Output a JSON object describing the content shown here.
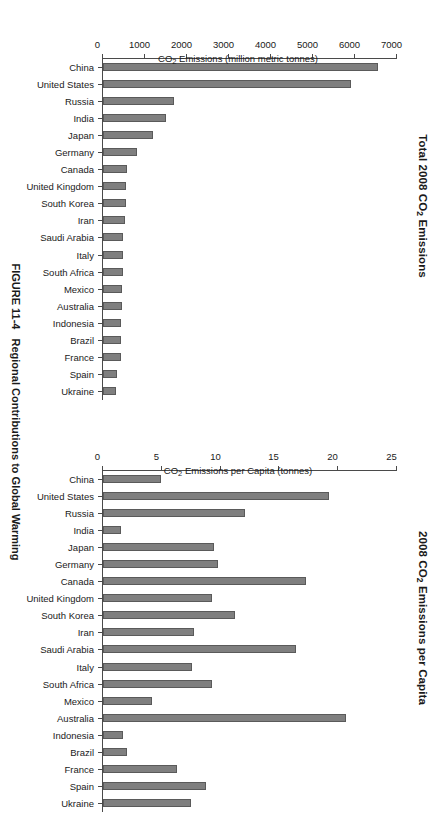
{
  "figure": {
    "number": "FIGURE 11-4",
    "caption": "Regional Contributions to Global Warming"
  },
  "chart_data": [
    {
      "type": "bar",
      "id": "total-emissions",
      "title": "Total 2008 CO2 Emissions",
      "title_main": "Total 2008 CO",
      "title_sub": "2",
      "title_tail": " Emissions",
      "xlabel": "",
      "ylabel": "CO2 Emissions (million metric tonnes)",
      "ylabel_main": "CO",
      "ylabel_sub": "2",
      "ylabel_tail": " Emissions (million metric tonnes)",
      "ylim": [
        0,
        7000
      ],
      "yticks": [
        0,
        1000,
        2000,
        3000,
        4000,
        5000,
        6000,
        7000
      ],
      "ytick_labels": [
        "0",
        "1000",
        "2000",
        "3000",
        "4000",
        "5000",
        "6000",
        "7000"
      ],
      "grid": false,
      "legend": "none",
      "orientation": "vertical-bars",
      "categories": [
        "China",
        "United States",
        "Russia",
        "India",
        "Japan",
        "Germany",
        "Canada",
        "United Kingdom",
        "South Korea",
        "Iran",
        "Saudi Arabia",
        "Italy",
        "South Africa",
        "Mexico",
        "Australia",
        "Indonesia",
        "Brazil",
        "France",
        "Spain",
        "Ukraine"
      ],
      "values": [
        6550,
        5900,
        1700,
        1500,
        1200,
        810,
        560,
        550,
        540,
        520,
        480,
        470,
        470,
        460,
        450,
        440,
        430,
        420,
        330,
        320
      ]
    },
    {
      "type": "bar",
      "id": "per-capita-emissions",
      "title": "2008 CO2 Emissions per Capita",
      "title_main": "2008 CO",
      "title_sub": "2",
      "title_tail": " Emissions per Capita",
      "xlabel": "",
      "ylabel": "CO2 Emissions per Capita (tonnes)",
      "ylabel_main": "CO",
      "ylabel_sub": "2",
      "ylabel_tail": " Emissions per Capita (tonnes)",
      "ylim": [
        0,
        25
      ],
      "yticks": [
        0,
        5,
        10,
        15,
        20,
        25
      ],
      "ytick_labels": [
        "0",
        "5",
        "10",
        "15",
        "20",
        "25"
      ],
      "grid": false,
      "legend": "none",
      "orientation": "vertical-bars",
      "categories": [
        "China",
        "United States",
        "Russia",
        "India",
        "Japan",
        "Germany",
        "Canada",
        "United Kingdom",
        "South Korea",
        "Iran",
        "Saudi Arabia",
        "Italy",
        "South Africa",
        "Mexico",
        "Australia",
        "Indonesia",
        "Brazil",
        "France",
        "Spain",
        "Ukraine"
      ],
      "values": [
        4.9,
        19.2,
        12.1,
        1.5,
        9.4,
        9.8,
        17.3,
        9.3,
        11.2,
        7.7,
        16.4,
        7.6,
        9.3,
        4.2,
        20.7,
        1.7,
        2.0,
        6.3,
        8.8,
        7.5
      ]
    }
  ],
  "colors": {
    "bar_fill": "#7f7f7f",
    "bar_stroke": "#5a5a5a",
    "axis": "#4a4a4a",
    "text": "#1a1a1a",
    "background": "#ffffff"
  }
}
